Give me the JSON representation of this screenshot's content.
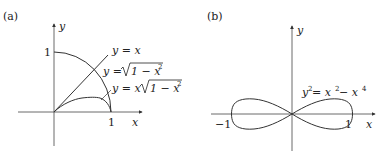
{
  "panels": [
    {
      "id": "a",
      "label": "(a)",
      "axes": {
        "x_label": "x",
        "y_label": "y",
        "x_tick": "1",
        "y_tick": "1"
      },
      "curves": [
        {
          "name": "line",
          "equation": "y = x"
        },
        {
          "name": "quarter-circle",
          "equation": "y = √(1 − x²)",
          "label_lhs": "y = ",
          "label_rad": "1 − x",
          "label_exp": "2"
        },
        {
          "name": "product",
          "equation": "y = x√(1 − x²)",
          "label_lhs": "y = x",
          "label_rad": "1 − x",
          "label_exp": "2"
        }
      ]
    },
    {
      "id": "b",
      "label": "(b)",
      "axes": {
        "x_label": "x",
        "y_label": "y",
        "x_tick_neg": "−1",
        "x_tick_pos": "1"
      },
      "curves": [
        {
          "name": "lemniscate",
          "equation": "y² = x² − x⁴",
          "label_y": "y",
          "label_eq": " = x",
          "label_minus": " − x",
          "exp2": "2",
          "exp4": "4"
        }
      ]
    }
  ]
}
